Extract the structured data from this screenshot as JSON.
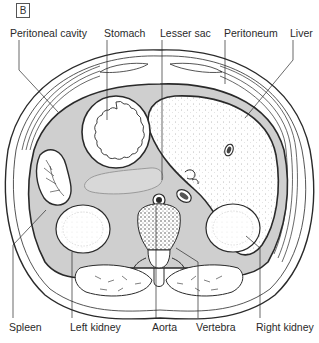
{
  "figure": {
    "panel_label": "B",
    "colors": {
      "line": "#2a2a2a",
      "peritoneal_shade": "#cfcfcf",
      "organ_fill": "#ffffff",
      "lesser_sac_shade": "#d8d8d8",
      "background": "#ffffff"
    }
  },
  "labels": {
    "top": [
      {
        "id": "peritoneal-cavity",
        "text": "Peritoneal cavity"
      },
      {
        "id": "stomach",
        "text": "Stomach"
      },
      {
        "id": "lesser-sac",
        "text": "Lesser sac"
      },
      {
        "id": "peritoneum",
        "text": "Peritoneum"
      },
      {
        "id": "liver",
        "text": "Liver"
      }
    ],
    "bottom": [
      {
        "id": "spleen",
        "text": "Spleen"
      },
      {
        "id": "left-kidney",
        "text": "Left kidney"
      },
      {
        "id": "aorta",
        "text": "Aorta"
      },
      {
        "id": "vertebra",
        "text": "Vertebra"
      },
      {
        "id": "right-kidney",
        "text": "Right kidney"
      }
    ]
  }
}
